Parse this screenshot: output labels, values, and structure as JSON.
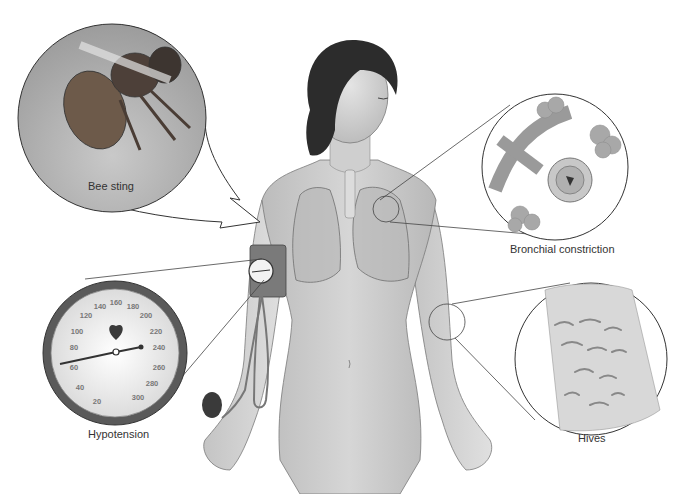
{
  "figure": {
    "callouts": [
      {
        "id": "bee-sting",
        "label": "Bee sting"
      },
      {
        "id": "hypotension",
        "label": "Hypotension"
      },
      {
        "id": "bronchial",
        "label": "Bronchial constriction"
      },
      {
        "id": "hives",
        "label": "Hives"
      }
    ],
    "gauge": {
      "ticks": [
        "20",
        "40",
        "60",
        "80",
        "100",
        "120",
        "140",
        "160",
        "180",
        "200",
        "220",
        "240",
        "260",
        "280",
        "300"
      ],
      "needle_reading": "~75 to ~235",
      "icon": "heart-icon"
    }
  }
}
